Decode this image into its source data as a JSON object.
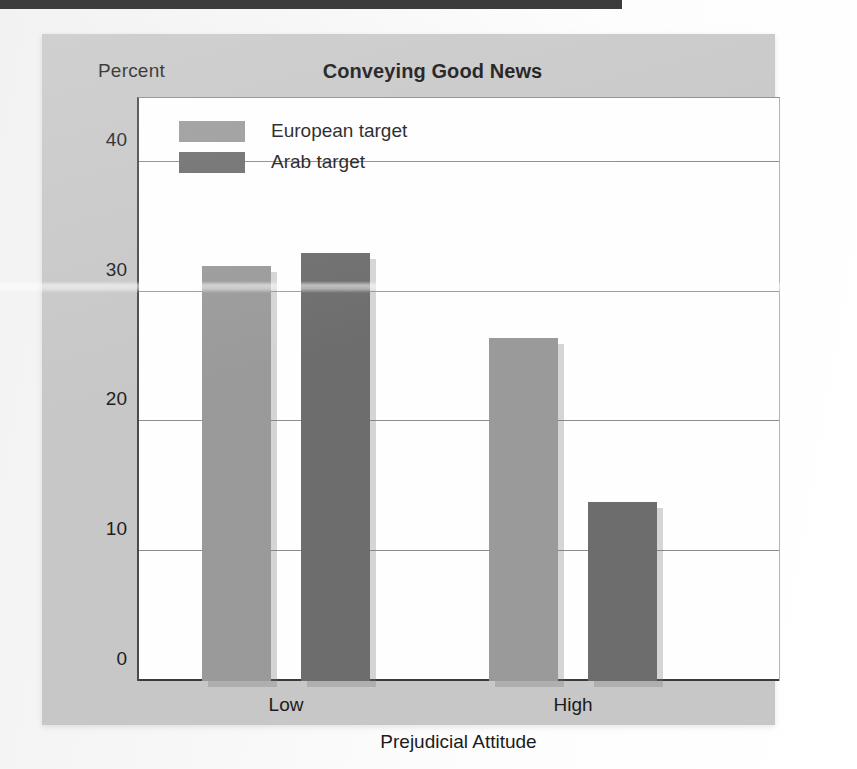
{
  "figure": {
    "ylabel_top": "Percent",
    "title": "Conveying Good News",
    "xaxis_title": "Prejudicial Attitude"
  },
  "colors": {
    "european_target": "#9a9a9a",
    "arab_target": "#6d6d6d",
    "panel": "#c7c7c7",
    "plot_background": "#fefefe",
    "gridline": "#8b8b8b",
    "axis": "#3a3a3a",
    "top_band": "#3c3c3c"
  },
  "chart_data": {
    "type": "bar",
    "title": "Conveying Good News",
    "xlabel": "Prejudicial Attitude",
    "ylabel": "Percent",
    "categories": [
      "Low",
      "High"
    ],
    "series": [
      {
        "name": "European target",
        "values": [
          32.0,
          26.4
        ],
        "color": "#9a9a9a"
      },
      {
        "name": "Arab target",
        "values": [
          33.0,
          13.8
        ],
        "color": "#6d6d6d"
      }
    ],
    "ylim": [
      0,
      45
    ],
    "yticks": [
      0,
      10,
      20,
      30,
      40
    ],
    "ytick_labels": [
      "0",
      "10",
      "20",
      "30",
      "40"
    ],
    "grid": true,
    "legend_position": "top-left-inside"
  }
}
